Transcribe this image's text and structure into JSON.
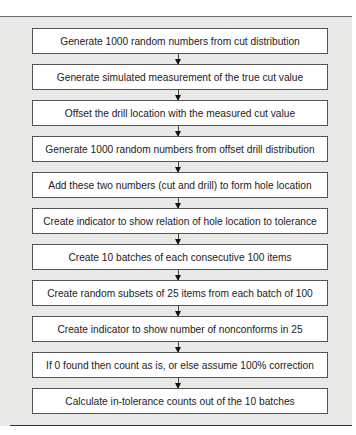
{
  "flowchart": {
    "steps": [
      {
        "label": "Generate 1000 random numbers from cut distribution"
      },
      {
        "label": "Generate simulated measurement of the true cut value"
      },
      {
        "label": "Offset the drill location with the measured cut value"
      },
      {
        "label": "Generate 1000 random numbers from offset drill distribution"
      },
      {
        "label": "Add these two numbers (cut and drill) to form hole location"
      },
      {
        "label": "Create indicator to show relation of hole location to tolerance"
      },
      {
        "label": "Create 10 batches of each consecutive 100 items"
      },
      {
        "label": "Create random subsets of 25 items from each batch of 100"
      },
      {
        "label": "Create indicator to show number of nonconforms in 25"
      },
      {
        "label": "If 0 found then count as is, or else assume 100% correction"
      },
      {
        "label": "Calculate in-tolerance counts out of the 10 batches"
      }
    ]
  },
  "colors": {
    "panel_background": "#e9e9e7",
    "box_fill": "#ffffff",
    "box_border": "#555555",
    "arrow": "#111111"
  }
}
